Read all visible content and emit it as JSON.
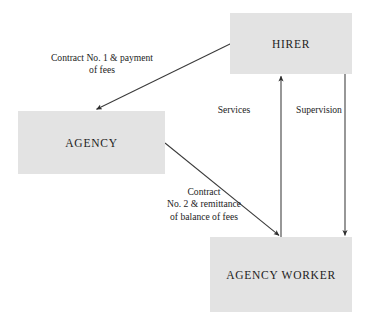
{
  "diagram": {
    "background_color": "#ffffff",
    "node_fill_color": "#e3e3e3",
    "line_color": "#3a3a3a",
    "nodes": [
      {
        "id": "hirer",
        "label": "HIRER"
      },
      {
        "id": "agency",
        "label": "AGENCY"
      },
      {
        "id": "agency_worker",
        "label": "AGENCY WORKER"
      }
    ],
    "edges": [
      {
        "id": "contract_one",
        "from": "hirer",
        "to": "agency",
        "label": "Contract No. 1 & payment\nof fees",
        "direction": "hirer-to-agency"
      },
      {
        "id": "contract_two",
        "from": "agency",
        "to": "agency_worker",
        "label": "Contract\nNo. 2 & remittance\nof balance of fees",
        "direction": "agency-to-agency-worker"
      },
      {
        "id": "services",
        "from": "agency_worker",
        "to": "hirer",
        "label": "Services",
        "direction": "worker-to-hirer"
      },
      {
        "id": "supervision",
        "from": "hirer",
        "to": "agency_worker",
        "label": "Supervision",
        "direction": "hirer-to-worker"
      }
    ]
  }
}
